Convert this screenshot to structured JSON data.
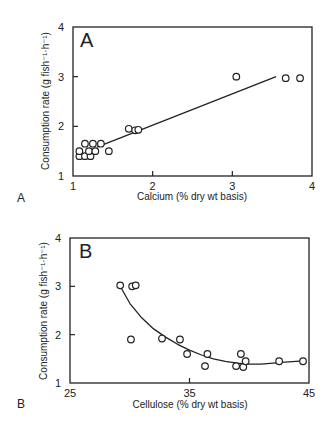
{
  "chart_data": [
    {
      "type": "scatter",
      "panel_label": "A",
      "figure_label": "A",
      "title": "",
      "xlabel": "Calcium (% dry wt basis)",
      "ylabel": "Consumption rate (g fish⁻¹·h⁻¹)",
      "xlim": [
        1,
        4
      ],
      "ylim": [
        1,
        4
      ],
      "xticks": [
        "1",
        "2",
        "3",
        "4"
      ],
      "yticks": [
        "1",
        "2",
        "3",
        "4"
      ],
      "grid": false,
      "points": [
        {
          "x": 1.08,
          "y": 1.4
        },
        {
          "x": 1.15,
          "y": 1.4
        },
        {
          "x": 1.22,
          "y": 1.4
        },
        {
          "x": 1.08,
          "y": 1.5
        },
        {
          "x": 1.2,
          "y": 1.5
        },
        {
          "x": 1.28,
          "y": 1.5
        },
        {
          "x": 1.15,
          "y": 1.65
        },
        {
          "x": 1.25,
          "y": 1.65
        },
        {
          "x": 1.35,
          "y": 1.65
        },
        {
          "x": 1.45,
          "y": 1.5
        },
        {
          "x": 1.7,
          "y": 1.95
        },
        {
          "x": 1.78,
          "y": 1.92
        },
        {
          "x": 1.82,
          "y": 1.93
        },
        {
          "x": 3.05,
          "y": 3.0
        },
        {
          "x": 3.67,
          "y": 2.97
        },
        {
          "x": 3.85,
          "y": 2.97
        }
      ],
      "fit": {
        "type": "linear",
        "x": [
          1.3,
          3.55
        ],
        "y": [
          1.58,
          3.0
        ]
      }
    },
    {
      "type": "scatter",
      "panel_label": "B",
      "figure_label": "B",
      "title": "",
      "xlabel": "Cellulose (% dry wt basis)",
      "ylabel": "Consumption rate (g fish⁻¹·h⁻¹)",
      "xlim": [
        25,
        45
      ],
      "ylim": [
        1,
        4
      ],
      "xticks": [
        "25",
        "35",
        "45"
      ],
      "yticks": [
        "1",
        "2",
        "3",
        "4"
      ],
      "grid": false,
      "points": [
        {
          "x": 29.2,
          "y": 3.02
        },
        {
          "x": 30.2,
          "y": 3.0
        },
        {
          "x": 30.5,
          "y": 3.02
        },
        {
          "x": 30.1,
          "y": 1.9
        },
        {
          "x": 32.7,
          "y": 1.92
        },
        {
          "x": 34.2,
          "y": 1.9
        },
        {
          "x": 34.8,
          "y": 1.6
        },
        {
          "x": 36.5,
          "y": 1.6
        },
        {
          "x": 36.3,
          "y": 1.35
        },
        {
          "x": 38.9,
          "y": 1.35
        },
        {
          "x": 39.3,
          "y": 1.6
        },
        {
          "x": 39.5,
          "y": 1.33
        },
        {
          "x": 39.7,
          "y": 1.45
        },
        {
          "x": 42.5,
          "y": 1.45
        },
        {
          "x": 44.5,
          "y": 1.45
        }
      ],
      "fit": {
        "type": "curve",
        "x": [
          29.2,
          30,
          31,
          32,
          33,
          34,
          35,
          36,
          37,
          38,
          39,
          40,
          41,
          42,
          43,
          44.5
        ],
        "y": [
          3.0,
          2.65,
          2.35,
          2.12,
          1.95,
          1.8,
          1.68,
          1.58,
          1.5,
          1.45,
          1.41,
          1.39,
          1.39,
          1.41,
          1.43,
          1.46
        ]
      }
    }
  ]
}
